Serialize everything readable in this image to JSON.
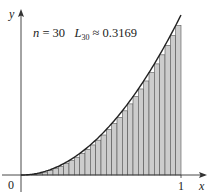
{
  "chart_data": {
    "type": "bar",
    "title": "",
    "function": "y = x^2",
    "method": "left endpoint Riemann sum",
    "n": 30,
    "annotation": {
      "n_label": "n",
      "n_value": "= 30",
      "L_symbol": "L",
      "L_subscript": "30",
      "L_value": "≈ 0.3169"
    },
    "xlabel": "x",
    "ylabel": "y",
    "x_ticks": [
      "0",
      "1"
    ],
    "xlim": [
      0,
      1
    ],
    "ylim": [
      0,
      1
    ],
    "grid": false,
    "bar_fill": "#cccccc",
    "bar_stroke": "#555555",
    "curve_color": "#222222"
  }
}
